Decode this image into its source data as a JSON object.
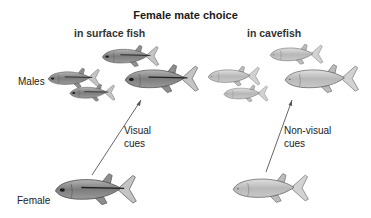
{
  "diagram": {
    "title": "Female mate choice",
    "columns": [
      {
        "heading": "in surface fish",
        "cue_label": [
          "Visual",
          "cues"
        ]
      },
      {
        "heading": "in cavefish",
        "cue_label": [
          "Non-visual",
          "cues"
        ]
      }
    ],
    "row_labels": {
      "males": "Males",
      "female": "Female"
    },
    "colors": {
      "surface_fish_body": "#8a8a8a",
      "surface_fish_stripe": "#2a2a2a",
      "cavefish_body": "#bdbdbd",
      "outline": "#555555",
      "arrow": "#555555",
      "text": "#1a1a1a"
    }
  }
}
